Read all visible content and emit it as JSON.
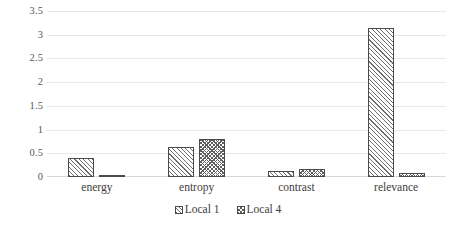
{
  "chart_data": {
    "type": "bar",
    "title": "",
    "xlabel": "",
    "ylabel": "",
    "categories": [
      "energy",
      "entropy",
      "contrast",
      "relevance"
    ],
    "series": [
      {
        "name": "Local 1",
        "values": [
          0.4,
          0.64,
          0.12,
          3.17
        ],
        "pattern": "diagonal-hatch"
      },
      {
        "name": "Local 4",
        "values": [
          0.03,
          0.8,
          0.16,
          0.08
        ],
        "pattern": "checker-dot"
      }
    ],
    "ylim": [
      0,
      3.5
    ],
    "ytick_labels": [
      "3.5",
      "3",
      "2.5",
      "2",
      "1.5",
      "1",
      "0.5",
      "0"
    ],
    "ytick_values": [
      3.5,
      3,
      2.5,
      2,
      1.5,
      1,
      0.5,
      0
    ],
    "grid": true,
    "legend_position": "bottom-center",
    "colors": {
      "gridline": "#e8e8e8",
      "bar_outline": "#4a4a4a",
      "hatch": "#6e6e6e",
      "text": "#3d3d3d"
    }
  }
}
